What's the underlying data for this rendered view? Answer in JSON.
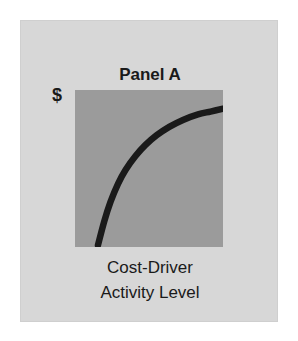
{
  "figure": {
    "panel_title": "Panel A",
    "y_axis_label": "$",
    "x_axis_label_line1": "Cost-Driver",
    "x_axis_label_line2": "Activity Level",
    "colors": {
      "page_background": "#ffffff",
      "card_background": "#d7d7d7",
      "plot_background": "#9b9b9b",
      "curve": "#1a1a1a",
      "text": "#1a1a1a"
    }
  },
  "chart_data": {
    "type": "line",
    "title": "Panel A",
    "subtitle": "",
    "xlabel": "Cost-Driver Activity Level",
    "ylabel": "$",
    "xlim": [
      0,
      100
    ],
    "ylim": [
      0,
      100
    ],
    "grid": false,
    "legend": "none",
    "xticklabels": [],
    "yticklabels": [],
    "annotations": [],
    "series": [
      {
        "name": "Curvilinear cost behavior",
        "shape": "concave-down increasing",
        "x": [
          0,
          5,
          10,
          16,
          22,
          30,
          38,
          47,
          57,
          68,
          80,
          90,
          100
        ],
        "y": [
          0,
          17,
          31,
          44,
          54,
          64,
          72,
          79,
          85,
          90,
          94,
          96,
          98
        ]
      }
    ]
  }
}
